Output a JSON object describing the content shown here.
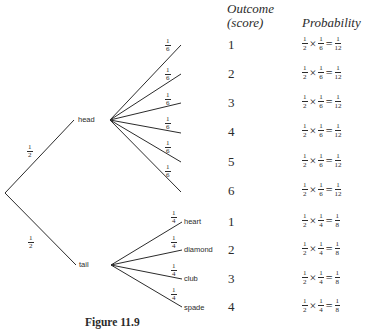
{
  "headers": {
    "outcome_line1": "Outcome",
    "outcome_line2": "(score)",
    "probability": "Probability"
  },
  "tree": {
    "root_branches": [
      {
        "label": "head",
        "prob_num": "1",
        "prob_den": "2"
      },
      {
        "label": "tail",
        "prob_num": "1",
        "prob_den": "2"
      }
    ],
    "head_branches": [
      {
        "prob_num": "1",
        "prob_den": "6"
      },
      {
        "prob_num": "1",
        "prob_den": "6"
      },
      {
        "prob_num": "1",
        "prob_den": "6"
      },
      {
        "prob_num": "1",
        "prob_den": "6"
      },
      {
        "prob_num": "1",
        "prob_den": "6"
      },
      {
        "prob_num": "1",
        "prob_den": "6"
      }
    ],
    "tail_branches": [
      {
        "label": "heart",
        "prob_num": "1",
        "prob_den": "4"
      },
      {
        "label": "diamond",
        "prob_num": "1",
        "prob_den": "4"
      },
      {
        "label": "club",
        "prob_num": "1",
        "prob_den": "4"
      },
      {
        "label": "spade",
        "prob_num": "1",
        "prob_den": "4"
      }
    ]
  },
  "rows": [
    {
      "outcome": "1",
      "a_num": "1",
      "a_den": "2",
      "times": "×",
      "b_num": "1",
      "b_den": "6",
      "eq": "=",
      "r_num": "1",
      "r_den": "12"
    },
    {
      "outcome": "2",
      "a_num": "1",
      "a_den": "2",
      "times": "×",
      "b_num": "1",
      "b_den": "6",
      "eq": "=",
      "r_num": "1",
      "r_den": "12"
    },
    {
      "outcome": "3",
      "a_num": "1",
      "a_den": "2",
      "times": "×",
      "b_num": "1",
      "b_den": "6",
      "eq": "=",
      "r_num": "1",
      "r_den": "12"
    },
    {
      "outcome": "4",
      "a_num": "1",
      "a_den": "2",
      "times": "×",
      "b_num": "1",
      "b_den": "6",
      "eq": "=",
      "r_num": "1",
      "r_den": "12"
    },
    {
      "outcome": "5",
      "a_num": "1",
      "a_den": "2",
      "times": "×",
      "b_num": "1",
      "b_den": "6",
      "eq": "=",
      "r_num": "1",
      "r_den": "12"
    },
    {
      "outcome": "6",
      "a_num": "1",
      "a_den": "2",
      "times": "×",
      "b_num": "1",
      "b_den": "6",
      "eq": "=",
      "r_num": "1",
      "r_den": "12"
    },
    {
      "outcome": "1",
      "a_num": "1",
      "a_den": "2",
      "times": "×",
      "b_num": "1",
      "b_den": "4",
      "eq": "=",
      "r_num": "1",
      "r_den": "8"
    },
    {
      "outcome": "2",
      "a_num": "1",
      "a_den": "2",
      "times": "×",
      "b_num": "1",
      "b_den": "4",
      "eq": "=",
      "r_num": "1",
      "r_den": "8"
    },
    {
      "outcome": "3",
      "a_num": "1",
      "a_den": "2",
      "times": "×",
      "b_num": "1",
      "b_den": "4",
      "eq": "=",
      "r_num": "1",
      "r_den": "8"
    },
    {
      "outcome": "4",
      "a_num": "1",
      "a_den": "2",
      "times": "×",
      "b_num": "1",
      "b_den": "4",
      "eq": "=",
      "r_num": "1",
      "r_den": "8"
    }
  ],
  "caption": "Figure 11.9",
  "colors": {
    "ink": "#2b2b2b",
    "background": "#ffffff"
  }
}
